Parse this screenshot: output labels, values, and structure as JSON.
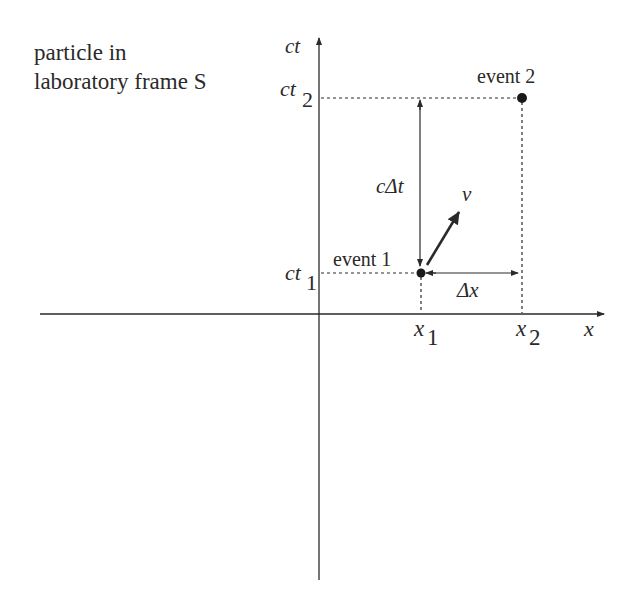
{
  "title": {
    "line1": "particle in",
    "line2": "laboratory frame S"
  },
  "axes": {
    "vertical_label": "ct",
    "horizontal_label": "x"
  },
  "ticks": {
    "ct2_base": "ct",
    "ct2_sub": "2",
    "ct1_base": "ct",
    "ct1_sub": "1",
    "x1_base": "x",
    "x1_sub": "1",
    "x2_base": "x",
    "x2_sub": "2"
  },
  "events": {
    "event1": "event 1",
    "event2": "event 2"
  },
  "annotations": {
    "c_delta_t": "cΔt",
    "delta_x": "Δx",
    "velocity": "v"
  },
  "colors": {
    "ink": "#2a2a2a",
    "background": "#ffffff"
  }
}
